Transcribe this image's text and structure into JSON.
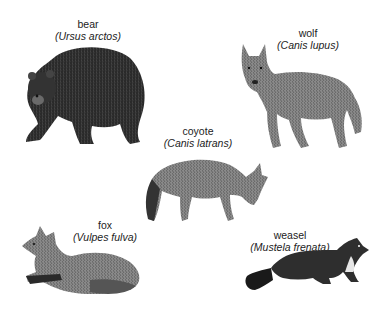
{
  "animals": [
    {
      "common": "bear",
      "scientific": "(Ursus arctos)"
    },
    {
      "common": "wolf",
      "scientific": "(Canis lupus)"
    },
    {
      "common": "coyote",
      "scientific": "(Canis latrans)"
    },
    {
      "common": "fox",
      "scientific": "(Vulpes fulva)"
    },
    {
      "common": "weasel",
      "scientific": "(Mustela frenata)"
    }
  ]
}
